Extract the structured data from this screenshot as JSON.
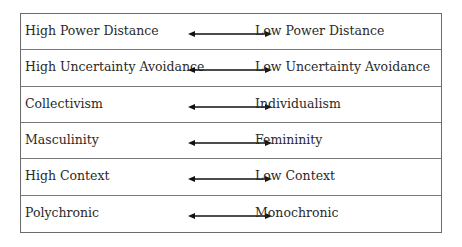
{
  "diagram": {
    "rows": [
      {
        "left": "High Power Distance",
        "right": "Low Power Distance"
      },
      {
        "left": "High Uncertainty Avoidance",
        "right": "Low Uncertainty Avoidance"
      },
      {
        "left": "Collectivism",
        "right": "Individualism"
      },
      {
        "left": "Masculinity",
        "right": "Femininity"
      },
      {
        "left": "High Context",
        "right": "Low Context"
      },
      {
        "left": "Polychronic",
        "right": "Monochronic"
      }
    ],
    "arrow_icon": "double-headed-arrow-icon"
  }
}
